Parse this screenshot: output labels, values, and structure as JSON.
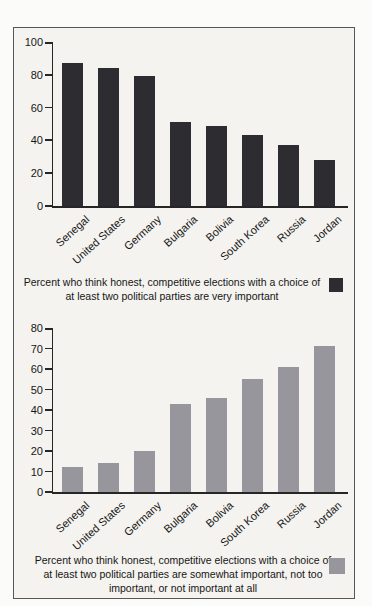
{
  "figure": {
    "background_color": "#f4f3ef",
    "frame_border_color": "#57575a",
    "axis_color": "#262626"
  },
  "chart_data": [
    {
      "type": "bar",
      "categories": [
        "Senegal",
        "United States",
        "Germany",
        "Bulgaria",
        "Bolivia",
        "South Korea",
        "Russia",
        "Jordan"
      ],
      "values": [
        87,
        84,
        79,
        51,
        49,
        43,
        37,
        28
      ],
      "title": "",
      "xlabel": "",
      "ylabel": "",
      "ylim": [
        0,
        100
      ],
      "yticks": [
        0,
        20,
        40,
        60,
        80,
        100
      ],
      "grid": false,
      "bar_color": "#2d2c31",
      "legend_position": "below-right",
      "legend_label": "Percent who think honest, competitive elections with a choice of at least two political parties are very important"
    },
    {
      "type": "bar",
      "categories": [
        "Senegal",
        "United States",
        "Germany",
        "Bulgaria",
        "Bolivia",
        "South Korea",
        "Russia",
        "Jordan"
      ],
      "values": [
        12,
        14,
        20,
        43,
        46,
        55,
        61,
        71
      ],
      "title": "",
      "xlabel": "",
      "ylabel": "",
      "ylim": [
        0,
        80
      ],
      "yticks": [
        0,
        10,
        20,
        30,
        40,
        50,
        60,
        70,
        80
      ],
      "grid": false,
      "bar_color": "#97969c",
      "legend_position": "below-right",
      "legend_label": "Percent who think honest, competitive elections with a choice of at least two political parties are somewhat important, not too important, or not important at all"
    }
  ]
}
